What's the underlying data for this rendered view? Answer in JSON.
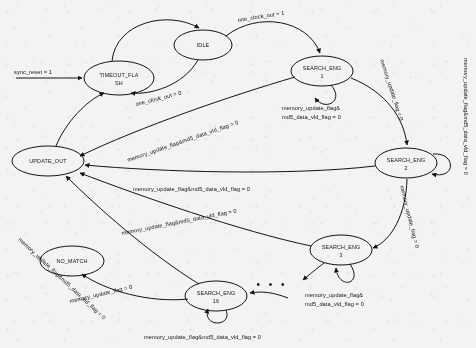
{
  "diagram": {
    "type": "state-machine",
    "width": 476,
    "height": 348,
    "background_color": "#f4f3f1",
    "ink_color": "#15130f",
    "states": [
      {
        "id": "timeout_flash",
        "label_line1": "TIMEOUT_FLA",
        "label_line2": "SH",
        "cx": 119,
        "cy": 78,
        "rx": 35,
        "ry": 17
      },
      {
        "id": "idle",
        "label_line1": "IDLE",
        "label_line2": "",
        "cx": 203,
        "cy": 45,
        "rx": 29,
        "ry": 15
      },
      {
        "id": "search_eng_1",
        "label_line1": "SEARCH_ENG",
        "label_line2": "1",
        "cx": 322,
        "cy": 71,
        "rx": 31,
        "ry": 15
      },
      {
        "id": "search_eng_2",
        "label_line1": "SEARCH_ENG",
        "label_line2": "2",
        "cx": 406,
        "cy": 163,
        "rx": 31,
        "ry": 15
      },
      {
        "id": "search_eng_3",
        "label_line1": "SEARCH_ENG",
        "label_line2": "3",
        "cx": 341,
        "cy": 250,
        "rx": 31,
        "ry": 15
      },
      {
        "id": "search_eng_16",
        "label_line1": "SEARCH_ENG",
        "label_line2": "16",
        "cx": 216,
        "cy": 296,
        "rx": 31,
        "ry": 15
      },
      {
        "id": "no_match",
        "label_line1": "NO_MATCH",
        "label_line2": "",
        "cx": 72,
        "cy": 261,
        "rx": 32,
        "ry": 15
      },
      {
        "id": "update_out",
        "label_line1": "UPDATE_OUT",
        "label_line2": "",
        "cx": 48,
        "cy": 161,
        "rx": 36,
        "ry": 15
      }
    ],
    "transitions": [
      {
        "id": "reset-in",
        "from": "",
        "to": "timeout_flash",
        "label": "sync_reset = 1"
      },
      {
        "id": "idle-to-timeout",
        "from": "idle",
        "to": "timeout_flash",
        "label": "one_clock_out = 0"
      },
      {
        "id": "idle-to-search1",
        "from": "idle",
        "to": "search_eng_1",
        "label": "one_clock_out = 1"
      },
      {
        "id": "search1-self",
        "from": "search_eng_1",
        "to": "search_eng_1",
        "label_line1": "memory_update_flag&",
        "label_line2": "md5_data_vld_flag = 0"
      },
      {
        "id": "search1-to-2",
        "from": "search_eng_1",
        "to": "search_eng_2",
        "label": "memory_update_flag = 0"
      },
      {
        "id": "search2-self",
        "from": "search_eng_2",
        "to": "search_eng_2",
        "label": "memory_update_flag&md5_data_vld_flag = 0"
      },
      {
        "id": "search2-to-3",
        "from": "search_eng_2",
        "to": "search_eng_3",
        "label": "memory_update_flag = 0"
      },
      {
        "id": "search3-self",
        "from": "search_eng_3",
        "to": "search_eng_3",
        "label_line1": "memory_update_flag&",
        "label_line2": "md5_data_vld_flag = 0"
      },
      {
        "id": "search16-self",
        "from": "search_eng_16",
        "to": "search_eng_16",
        "label": "memory_update_flag&md5_data_vld_flag = 0"
      },
      {
        "id": "search16-to-nomatch",
        "from": "search_eng_16",
        "to": "no_match",
        "label": "memory_update_flag = 0"
      },
      {
        "id": "search1-to-update",
        "from": "search_eng_1",
        "to": "update_out",
        "label": "memory_update_flag&md5_data_vld_flag = 0"
      },
      {
        "id": "search2-to-update",
        "from": "search_eng_2",
        "to": "update_out",
        "label": "memory_update_flag&md5_data_vld_flag = 0"
      },
      {
        "id": "search3-to-update",
        "from": "search_eng_3",
        "to": "update_out",
        "label": "memory_update_flag&md5_data_vld_flag = 0"
      },
      {
        "id": "search16-to-update",
        "from": "search_eng_16",
        "to": "update_out",
        "label": "memory_update_flag&md5_data_vld_flag = 0"
      },
      {
        "id": "update-to-timeout",
        "from": "update_out",
        "to": "timeout_flash",
        "label": ""
      },
      {
        "id": "timeout-to-idle",
        "from": "timeout_flash",
        "to": "idle",
        "label": ""
      }
    ],
    "ellipsis": "• • •"
  }
}
